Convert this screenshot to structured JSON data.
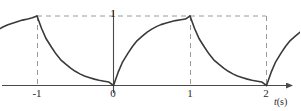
{
  "figure": {
    "name": "exponential-sawtooth-waveform",
    "background_color": "#ffffff",
    "curve_color": "#3a3a3a",
    "axis_color": "#4a4a4a",
    "dashed_color": "#9a9a9a",
    "text_color": "#2b2b2b"
  },
  "axes": {
    "x_axis_title": "t (s)",
    "x_axis_title_symbol": "t",
    "x_axis_title_unit": "(s)",
    "y_axis_title": "",
    "x_ticks": [
      {
        "value": -1,
        "label": "-1"
      },
      {
        "value": 0,
        "label": "0"
      },
      {
        "value": 1,
        "label": "1"
      },
      {
        "value": 2,
        "label": "2"
      }
    ],
    "y_ticks": [
      {
        "value": 1,
        "label": "1"
      }
    ],
    "xlim": [
      -1.5,
      2.5
    ],
    "ylim": [
      0,
      1.18
    ],
    "arrow_on_x_axis": true
  },
  "guides": {
    "horizontal_dashed_y": 1,
    "vertical_dashed_x": [
      -1,
      1,
      2
    ]
  },
  "chart_data": {
    "type": "line",
    "title": "",
    "subtitle": "",
    "xlabel": "t (s)",
    "ylabel": "",
    "xlim": [
      -1.5,
      2.5
    ],
    "ylim": [
      0,
      1.18
    ],
    "grid": false,
    "legend": "none",
    "period": 1,
    "peak_value": 1,
    "tau": 0.3,
    "annotations": [
      {
        "text": "1",
        "x": 0,
        "y": 1,
        "role": "y-tick-label"
      },
      {
        "text": "-1",
        "x": -1,
        "y": 0,
        "role": "x-tick-label"
      },
      {
        "text": "0",
        "x": 0,
        "y": 0,
        "role": "x-tick-label"
      },
      {
        "text": "1",
        "x": 1,
        "y": 0,
        "role": "x-tick-label"
      },
      {
        "text": "2",
        "x": 2,
        "y": 0,
        "role": "x-tick-label"
      },
      {
        "text": "t (s)",
        "x": 2.4,
        "y": -0.12,
        "role": "axis-title"
      }
    ],
    "series": [
      {
        "name": "v(t)",
        "segments": [
          {
            "name": "rise-before-minus-one",
            "kind": "exponential-rise",
            "x": [
              -1.5,
              -1.44,
              -1.38,
              -1.31,
              -1.25,
              -1.19,
              -1.12,
              -1.06,
              -1.0
            ],
            "y": [
              0.81,
              0.845,
              0.875,
              0.9,
              0.922,
              0.941,
              0.958,
              0.975,
              1.0
            ]
          },
          {
            "name": "decay-minus-one-to-zero",
            "kind": "exponential-decay",
            "x": [
              -1.0,
              -0.94,
              -0.88,
              -0.81,
              -0.75,
              -0.69,
              -0.62,
              -0.56,
              -0.5,
              -0.44,
              -0.38,
              -0.31,
              -0.25,
              -0.19,
              -0.12,
              -0.06,
              0.0
            ],
            "y": [
              1.0,
              0.82,
              0.672,
              0.551,
              0.452,
              0.37,
              0.303,
              0.249,
              0.204,
              0.167,
              0.137,
              0.112,
              0.092,
              0.075,
              0.062,
              0.05,
              0.0
            ]
          },
          {
            "name": "rise-zero-to-one",
            "kind": "exponential-rise",
            "x": [
              0.0,
              0.06,
              0.12,
              0.19,
              0.25,
              0.31,
              0.38,
              0.44,
              0.5,
              0.56,
              0.62,
              0.69,
              0.75,
              0.81,
              0.88,
              0.94,
              1.0
            ],
            "y": [
              0.0,
              0.188,
              0.341,
              0.465,
              0.565,
              0.647,
              0.713,
              0.767,
              0.811,
              0.847,
              0.876,
              0.899,
              0.918,
              0.934,
              0.946,
              0.956,
              1.0
            ]
          },
          {
            "name": "decay-one-to-two",
            "kind": "exponential-decay",
            "x": [
              1.0,
              1.06,
              1.12,
              1.19,
              1.25,
              1.31,
              1.38,
              1.44,
              1.5,
              1.56,
              1.62,
              1.69,
              1.75,
              1.81,
              1.88,
              1.94,
              2.0
            ],
            "y": [
              1.0,
              0.82,
              0.672,
              0.551,
              0.452,
              0.37,
              0.303,
              0.249,
              0.204,
              0.167,
              0.137,
              0.112,
              0.092,
              0.075,
              0.062,
              0.05,
              0.0
            ]
          },
          {
            "name": "rise-after-two",
            "kind": "exponential-rise",
            "x": [
              2.0,
              2.06,
              2.12,
              2.19,
              2.25,
              2.31,
              2.38,
              2.44,
              2.5
            ],
            "y": [
              0.0,
              0.188,
              0.341,
              0.465,
              0.565,
              0.647,
              0.713,
              0.767,
              0.811
            ]
          }
        ]
      }
    ]
  }
}
